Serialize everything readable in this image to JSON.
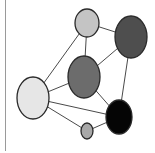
{
  "diagram": {
    "type": "network-graph",
    "nodes": [
      {
        "id": "A",
        "cx": 87,
        "cy": 23,
        "rx": 12,
        "ry": 14,
        "fill": "#c4c4c4"
      },
      {
        "id": "B",
        "cx": 131,
        "cy": 37,
        "rx": 16,
        "ry": 21,
        "fill": "#4e4e4e"
      },
      {
        "id": "C",
        "cx": 84,
        "cy": 77,
        "rx": 16,
        "ry": 21,
        "fill": "#6c6c6c"
      },
      {
        "id": "D",
        "cx": 33,
        "cy": 98,
        "rx": 16,
        "ry": 21,
        "fill": "#e6e6e6"
      },
      {
        "id": "E",
        "cx": 119,
        "cy": 117,
        "rx": 13,
        "ry": 17,
        "fill": "#050505"
      },
      {
        "id": "F",
        "cx": 87,
        "cy": 131,
        "rx": 6,
        "ry": 8,
        "fill": "#a8a8a8"
      }
    ],
    "edges": [
      [
        "A",
        "B"
      ],
      [
        "A",
        "C"
      ],
      [
        "A",
        "D"
      ],
      [
        "B",
        "C"
      ],
      [
        "B",
        "E"
      ],
      [
        "C",
        "D"
      ],
      [
        "C",
        "E"
      ],
      [
        "D",
        "E"
      ],
      [
        "D",
        "F"
      ],
      [
        "F",
        "E"
      ]
    ],
    "edge_color": "#4a4a4a",
    "node_stroke": "#2a2a2a"
  }
}
